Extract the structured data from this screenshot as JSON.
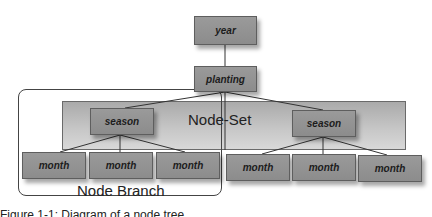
{
  "diagram": {
    "nodes": {
      "year": "year",
      "planting": "planting",
      "season_left": "season",
      "season_right": "season",
      "months_left": [
        "month",
        "month",
        "month"
      ],
      "months_right": [
        "month",
        "month",
        "month"
      ]
    },
    "regions": {
      "node_set": "Node-Set",
      "node_branch": "Node Branch"
    },
    "caption": "Figure 1-1: Diagram of a node tree"
  }
}
